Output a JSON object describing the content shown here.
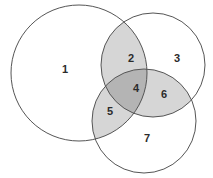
{
  "diagram": {
    "type": "venn",
    "background_color": "#ffffff",
    "outline_color": "#555555",
    "label_color": "#2b2b2b",
    "fill_none": "#ffffff",
    "fill_pair": "#d6d6d6",
    "fill_triple": "#b4b4b4",
    "sets": [
      {
        "id": "A",
        "name": "left-circle",
        "cx": 79,
        "cy": 73,
        "r": 68
      },
      {
        "id": "B",
        "name": "top-right-circle",
        "cx": 153,
        "cy": 65,
        "r": 52
      },
      {
        "id": "C",
        "name": "bottom-right-circle",
        "cx": 144,
        "cy": 121,
        "r": 52
      }
    ],
    "regions": [
      {
        "id": "r1",
        "label": "1",
        "sets": "A only",
        "shaded": "none",
        "fill": "#ffffff",
        "x": 65,
        "y": 70
      },
      {
        "id": "r2",
        "label": "2",
        "sets": "A and B",
        "shaded": "light",
        "fill": "#d6d6d6",
        "x": 131,
        "y": 59
      },
      {
        "id": "r3",
        "label": "3",
        "sets": "B only",
        "shaded": "none",
        "fill": "#ffffff",
        "x": 177,
        "y": 59
      },
      {
        "id": "r4",
        "label": "4",
        "sets": "A, B and C",
        "shaded": "dark",
        "fill": "#b4b4b4",
        "x": 136,
        "y": 89
      },
      {
        "id": "r5",
        "label": "5",
        "sets": "A and C",
        "shaded": "light",
        "fill": "#d6d6d6",
        "x": 110,
        "y": 112
      },
      {
        "id": "r6",
        "label": "6",
        "sets": "B and C",
        "shaded": "light",
        "fill": "#d6d6d6",
        "x": 164,
        "y": 95
      },
      {
        "id": "r7",
        "label": "7",
        "sets": "C only",
        "shaded": "none",
        "fill": "#ffffff",
        "x": 147,
        "y": 139
      }
    ]
  }
}
